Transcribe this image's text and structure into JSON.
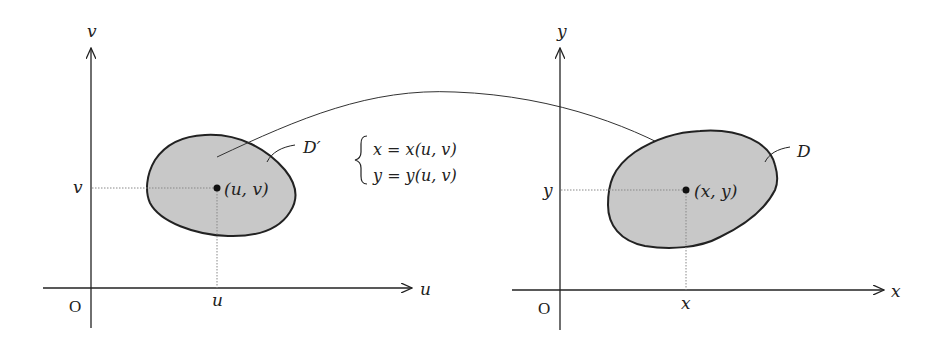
{
  "diagram": {
    "type": "change-of-variables mapping",
    "colors": {
      "region_fill": "#c8c8c8",
      "stroke": "#222222",
      "guide": "#888888",
      "background": "#ffffff"
    },
    "left_plane": {
      "horizontal_axis_label": "u",
      "vertical_axis_label": "v",
      "origin_label": "O",
      "tick_horizontal": "u",
      "tick_vertical": "v",
      "region_label": "D′",
      "point_label": "(u, v)"
    },
    "transformation": {
      "line1": "x = x(u, v)",
      "line2": "y = y(u, v)"
    },
    "right_plane": {
      "horizontal_axis_label": "x",
      "vertical_axis_label": "y",
      "origin_label": "O",
      "tick_horizontal": "x",
      "tick_vertical": "y",
      "region_label": "D",
      "point_label": "(x, y)"
    }
  }
}
